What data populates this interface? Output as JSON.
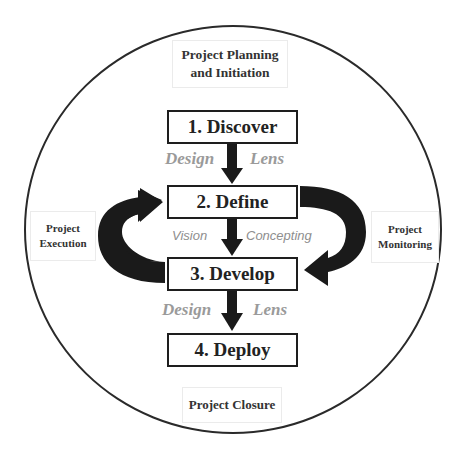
{
  "diagram": {
    "outer_label_top": {
      "line1": "Project Planning",
      "line2": "and Initiation"
    },
    "outer_label_left": {
      "line1": "Project",
      "line2": "Execution"
    },
    "outer_label_right": {
      "line1": "Project",
      "line2": "Monitoring"
    },
    "outer_label_bottom": {
      "line1": "Project Closure"
    },
    "phases": [
      {
        "label": "1. Discover"
      },
      {
        "label": "2. Define"
      },
      {
        "label": "3. Develop"
      },
      {
        "label": "4. Deploy"
      }
    ],
    "connector_labels": {
      "discover_define": {
        "left": "Design",
        "right": "Lens"
      },
      "define_develop": {
        "left": "Vision",
        "right": "Concepting"
      },
      "develop_deploy": {
        "left": "Design",
        "right": "Lens"
      }
    },
    "colors": {
      "stroke": "#1e1e1e",
      "arrow_fill": "#1a1a1a",
      "connector_text": "#9a9a9a",
      "label_text": "#333333"
    }
  }
}
